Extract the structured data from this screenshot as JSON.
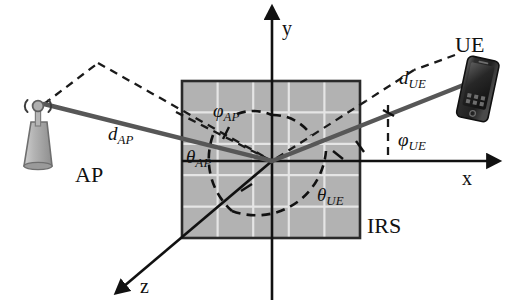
{
  "figure": {
    "background_color": "#ffffff"
  },
  "colors": {
    "irs_fill": "#b2b2b2",
    "irs_grid_line": "#e8e8e8",
    "irs_border": "#2a2a2a",
    "axis": "#111111",
    "ray_solid": "#575757",
    "dashed": "#1a1a1a",
    "ue_body": "#2b2b2b",
    "ap_body": "#a8a8a8"
  },
  "axes": [
    {
      "name": "y-axis",
      "label": "y",
      "direction": "up",
      "label_x": 282,
      "label_y": 18
    },
    {
      "name": "x-axis",
      "label": "x",
      "direction": "right",
      "label_x": 462,
      "label_y": 168
    },
    {
      "name": "z-axis",
      "label": "z",
      "direction": "down-left",
      "label_x": 140,
      "label_y": 276
    }
  ],
  "nodes": [
    {
      "id": "ap",
      "label": "AP",
      "icon": "base-station-antenna-icon",
      "label_x": 75,
      "label_y": 164
    },
    {
      "id": "ue",
      "label": "UE",
      "icon": "smartphone-icon",
      "label_x": 455,
      "label_y": 34
    },
    {
      "id": "irs",
      "label": "IRS",
      "icon": "reflecting-surface-panel",
      "label_x": 367,
      "label_y": 215
    }
  ],
  "distances": [
    {
      "id": "d_ap",
      "symbol": "d",
      "subscript": "AP",
      "label_x": 108,
      "label_y": 124
    },
    {
      "id": "d_ue",
      "symbol": "d",
      "subscript": "UE",
      "label_x": 399,
      "label_y": 68
    }
  ],
  "angles": [
    {
      "id": "phi_ap",
      "symbol": "φ",
      "subscript": "AP",
      "label_x": 213,
      "label_y": 101
    },
    {
      "id": "theta_ap",
      "symbol": "θ",
      "subscript": "AP",
      "label_x": 186,
      "label_y": 147
    },
    {
      "id": "phi_ue",
      "symbol": "φ",
      "subscript": "UE",
      "label_x": 398,
      "label_y": 130
    },
    {
      "id": "theta_ue",
      "symbol": "θ",
      "subscript": "UE",
      "label_x": 317,
      "label_y": 185
    }
  ],
  "irs_panel": {
    "x": 182,
    "y": 81,
    "width": 178,
    "height": 157,
    "grid_rows": 5,
    "grid_cols": 5
  },
  "origin": {
    "x": 272,
    "y": 161
  }
}
